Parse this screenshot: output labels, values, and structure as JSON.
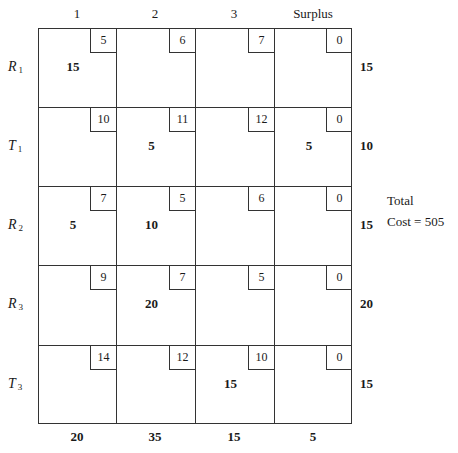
{
  "columns": [
    "1",
    "2",
    "3",
    "Surplus"
  ],
  "rows": [
    {
      "label": "R",
      "sub": "1",
      "costs": [
        "5",
        "6",
        "7",
        "0"
      ],
      "alloc": [
        "15",
        "",
        "",
        ""
      ],
      "supply": "15"
    },
    {
      "label": "T",
      "sub": "1",
      "costs": [
        "10",
        "11",
        "12",
        "0"
      ],
      "alloc": [
        "",
        "5",
        "",
        "5"
      ],
      "supply": "10"
    },
    {
      "label": "R",
      "sub": "2",
      "costs": [
        "7",
        "5",
        "6",
        "0"
      ],
      "alloc": [
        "5",
        "10",
        "",
        ""
      ],
      "supply": "15"
    },
    {
      "label": "R",
      "sub": "3",
      "costs": [
        "9",
        "7",
        "5",
        "0"
      ],
      "alloc": [
        "",
        "20",
        "",
        ""
      ],
      "supply": "20"
    },
    {
      "label": "T",
      "sub": "3",
      "costs": [
        "14",
        "12",
        "10",
        "0"
      ],
      "alloc": [
        "",
        "",
        "15",
        ""
      ],
      "supply": "15"
    }
  ],
  "demand": [
    "20",
    "35",
    "15",
    "5"
  ],
  "total": {
    "line1": "Total",
    "line2": "Cost = 505"
  }
}
